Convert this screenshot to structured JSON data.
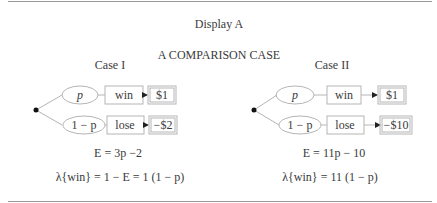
{
  "display_title": "Display A",
  "subtitle": "A COMPARISON CASE",
  "cases": [
    {
      "label": "Case I",
      "branches": [
        {
          "prob": "p",
          "outcome": "win",
          "payoff": "$1"
        },
        {
          "prob": "1 − p",
          "outcome": "lose",
          "payoff": "−$2"
        }
      ],
      "expectation": "E = 3p −2",
      "lambda": "λ{win} = 1 − E = 1 (1 − p)"
    },
    {
      "label": "Case II",
      "branches": [
        {
          "prob": "p",
          "outcome": "win",
          "payoff": "$1"
        },
        {
          "prob": "1 − p",
          "outcome": "lose",
          "payoff": "−$10"
        }
      ],
      "expectation": "E = 11p − 10",
      "lambda": "λ{win} = 11 (1 − p)"
    }
  ],
  "colors": {
    "line": "#b5b5b5",
    "text": "#3a3a3a",
    "rule": "#9a9a9a",
    "node": "#111111"
  }
}
